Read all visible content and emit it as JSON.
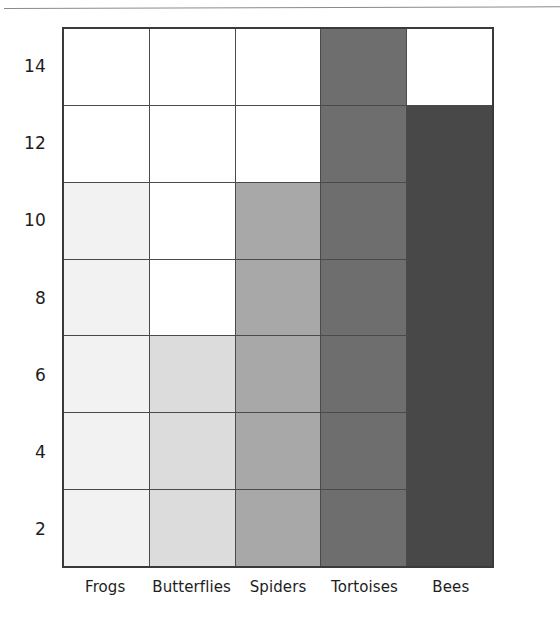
{
  "figure": {
    "top_rule_name": "page-rule"
  },
  "chart_data": {
    "type": "bar",
    "title": "",
    "subtitle": "",
    "xlabel": "",
    "ylabel": "",
    "categories": [
      "Frogs",
      "Butterflies",
      "Spiders",
      "Tortoises",
      "Bees"
    ],
    "values": [
      11,
      7,
      11,
      15,
      13
    ],
    "series": [
      {
        "name": "Count",
        "values": [
          11,
          7,
          11,
          15,
          13
        ]
      }
    ],
    "bar_colors": [
      "#f2f2f2",
      "#dcdcdc",
      "#a8a8a8",
      "#6e6e6e",
      "#484848"
    ],
    "ylim": [
      1,
      15
    ],
    "ytick_labels": [
      "14",
      "12",
      "10",
      "8",
      "6",
      "4",
      "2"
    ],
    "ytick_values": [
      14,
      12,
      10,
      8,
      6,
      4,
      2
    ],
    "gridline_values": [
      13,
      11,
      9,
      7,
      5,
      3
    ],
    "grid": true,
    "legend": "none",
    "axis_color": "#3a3a3a",
    "gridline_color": "#4a4a4a",
    "background": "#ffffff"
  },
  "footer": {
    "clipped_text": "                    ."
  }
}
